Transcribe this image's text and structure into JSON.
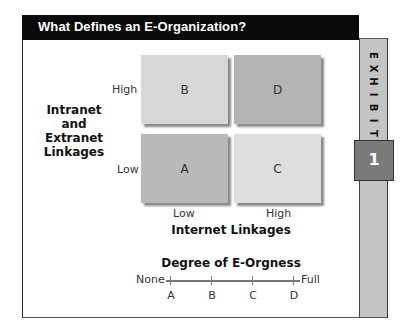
{
  "header": {
    "title": "What Defines an E-Organization?"
  },
  "exhibit": {
    "letters": [
      "E",
      "X",
      "H",
      "I",
      "B",
      "I",
      "T"
    ],
    "number": "1"
  },
  "colors": {
    "header_bg": "#0a0a0a",
    "sidebar": "#c4c4c4",
    "number_box": "#7a7a7a",
    "quad_A": "#b9b9b9",
    "quad_B": "#d7d7d7",
    "quad_C": "#dedede",
    "quad_D": "#b4b4b4"
  },
  "matrix": {
    "y_axis_label": [
      "Intranet",
      "and",
      "Extranet",
      "Linkages"
    ],
    "y_ticks": {
      "high": "High",
      "low": "Low"
    },
    "x_axis_label": "Internet Linkages",
    "x_ticks": {
      "low": "Low",
      "high": "High"
    },
    "quadrants": {
      "top_left": "B",
      "top_right": "D",
      "bottom_left": "A",
      "bottom_right": "C"
    }
  },
  "scale": {
    "title": "Degree of E-Orgness",
    "left_label": "None",
    "right_label": "Full",
    "ticks": [
      "A",
      "B",
      "C",
      "D"
    ]
  }
}
